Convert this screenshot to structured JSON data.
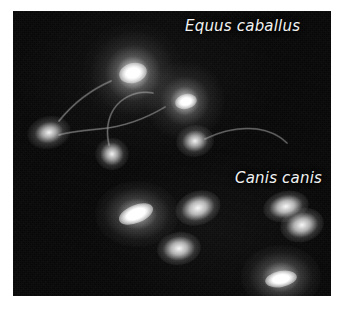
{
  "figure": {
    "type": "fluorescence-micrograph",
    "background_color": "#ffffff",
    "plate_color": "#070707",
    "label_color": "#f2f2f2"
  },
  "labels": {
    "equus": "Equus caballus",
    "canis": "Canis canis"
  },
  "specimens": {
    "equus_caballus": {
      "label": "Equus caballus",
      "region": "upper",
      "cell_count": 5,
      "cells": [
        {
          "id": "equus-head-1",
          "cx": 120,
          "cy": 62,
          "rx": 25,
          "ry": 22,
          "angle": 0,
          "brightness": "very-high",
          "has_tail": true
        },
        {
          "id": "equus-head-2",
          "cx": 172,
          "cy": 90,
          "rx": 18,
          "ry": 16,
          "angle": 0,
          "brightness": "high",
          "has_tail": true
        },
        {
          "id": "equus-head-3",
          "cx": 35,
          "cy": 121,
          "rx": 12,
          "ry": 8,
          "angle": -12,
          "brightness": "high",
          "has_tail": true
        },
        {
          "id": "equus-head-4",
          "cx": 99,
          "cy": 143,
          "rx": 10,
          "ry": 9,
          "angle": 0,
          "brightness": "high",
          "has_tail": true
        },
        {
          "id": "equus-head-5",
          "cx": 181,
          "cy": 130,
          "rx": 11,
          "ry": 9,
          "angle": -10,
          "brightness": "high",
          "has_tail": true
        }
      ]
    },
    "canis_canis": {
      "label": "Canis canis",
      "region": "lower",
      "cell_count": 6,
      "cells": [
        {
          "id": "canis-head-1",
          "cx": 123,
          "cy": 203,
          "rx": 17,
          "ry": 10,
          "angle": -22,
          "brightness": "very-high",
          "has_tail": false
        },
        {
          "id": "canis-head-2",
          "cx": 191,
          "cy": 200,
          "rx": 12,
          "ry": 8,
          "angle": -18,
          "brightness": "high",
          "has_tail": false
        },
        {
          "id": "canis-head-3",
          "cx": 170,
          "cy": 239,
          "rx": 11,
          "ry": 8,
          "angle": -8,
          "brightness": "high",
          "has_tail": false
        },
        {
          "id": "canis-head-4",
          "cx": 277,
          "cy": 198,
          "rx": 12,
          "ry": 7,
          "angle": -12,
          "brightness": "high",
          "has_tail": false
        },
        {
          "id": "canis-head-5",
          "cx": 293,
          "cy": 216,
          "rx": 11,
          "ry": 8,
          "angle": -14,
          "brightness": "high",
          "has_tail": false
        },
        {
          "id": "canis-head-6",
          "cx": 268,
          "cy": 268,
          "rx": 16,
          "ry": 11,
          "angle": -10,
          "brightness": "very-high",
          "has_tail": false
        }
      ]
    }
  },
  "tails": [
    {
      "id": "tail-1",
      "d": "M 98 70 C 80 78, 62 90, 46 110"
    },
    {
      "id": "tail-2",
      "d": "M 152 96 C 132 108, 110 116, 86 118 C 66 120, 52 122, 46 124"
    },
    {
      "id": "tail-3",
      "d": "M 96 134 C 92 116, 96 100, 108 90 C 118 82, 130 80, 140 82"
    },
    {
      "id": "tail-4",
      "d": "M 192 128 C 208 120, 226 116, 244 118 C 258 120, 268 126, 274 132"
    }
  ]
}
